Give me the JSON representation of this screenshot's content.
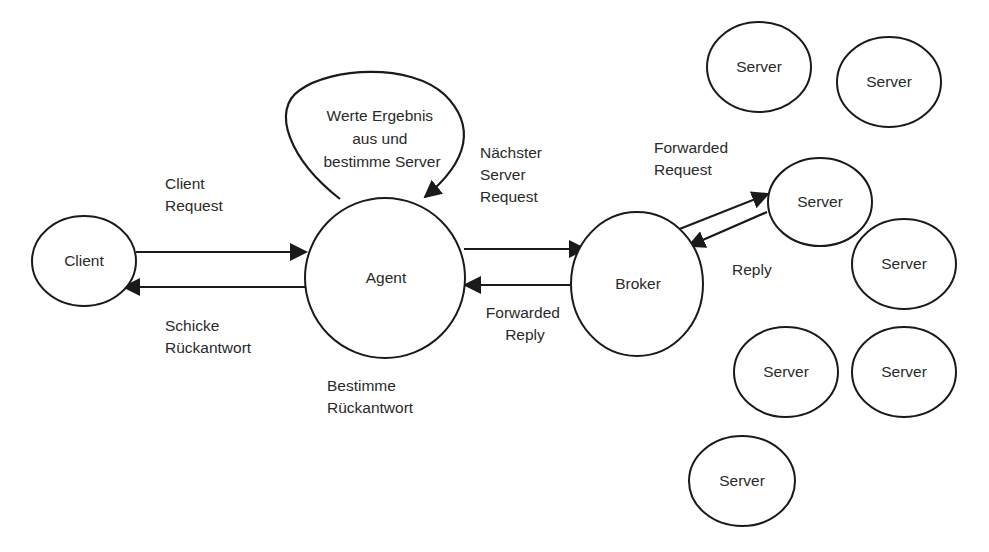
{
  "diagram": {
    "colors": {
      "stroke": "#1a1a1a",
      "text": "#2a2a2a",
      "background": "#ffffff"
    },
    "nodes": {
      "client": {
        "label": "Client"
      },
      "agent": {
        "label": "Agent"
      },
      "broker": {
        "label": "Broker"
      },
      "servers": [
        {
          "label": "Server"
        },
        {
          "label": "Server"
        },
        {
          "label": "Server"
        },
        {
          "label": "Server"
        },
        {
          "label": "Server"
        },
        {
          "label": "Server"
        },
        {
          "label": "Server"
        }
      ]
    },
    "edges": {
      "client_request": {
        "lines": [
          "Client",
          "Request"
        ]
      },
      "send_reply": {
        "lines": [
          "Schicke",
          "Rückantwort"
        ]
      },
      "self_loop": {
        "lines": [
          "Werte Ergebnis",
          "aus und",
          "bestimme Server"
        ]
      },
      "next_server_request": {
        "lines": [
          "Nächster",
          "Server",
          "Request"
        ]
      },
      "forwarded_reply": {
        "lines": [
          "Forwarded",
          "Reply"
        ]
      },
      "forwarded_request": {
        "lines": [
          "Forwarded",
          "Request"
        ]
      },
      "reply": {
        "lines": [
          "Reply"
        ]
      }
    },
    "annotations": {
      "determine_reply": {
        "lines": [
          "Bestimme",
          "Rückantwort"
        ]
      }
    }
  }
}
